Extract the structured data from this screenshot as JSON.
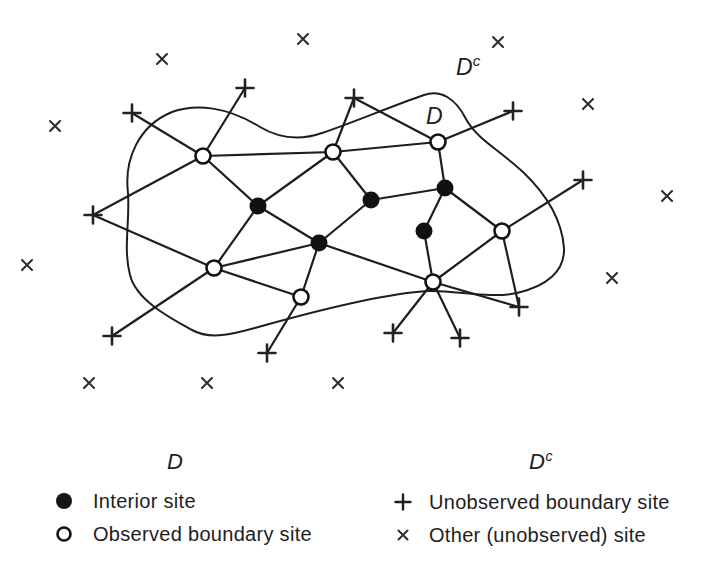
{
  "figure": {
    "width": 726,
    "height": 420,
    "ink_color": "#1e1e1e",
    "background_color": "#ffffff",
    "domain_label": {
      "text": "D",
      "x": 426,
      "y": 124
    },
    "complement_label": {
      "text": "D",
      "superscript": "c",
      "x": 456,
      "y": 75
    },
    "boundary_path": "M128,193 C124,160 138,126 172,112 C196,103 228,107 260,127 C282,140 302,140 322,133 C352,123 392,106 424,95 C441,89 456,99 466,119 C477,139 498,149 523,172 C546,194 562,220 564,248 C565,271 547,286 517,293 C489,299 456,290 428,291 C392,293 330,307 262,326 C236,333 212,341 192,330 C170,318 136,300 130,275 C123,248 130,222 128,193 Z",
    "sites": {
      "interior": [
        [
          258,
          206
        ],
        [
          319,
          243
        ],
        [
          371,
          200
        ],
        [
          445,
          188
        ],
        [
          424,
          231
        ]
      ],
      "observed_boundary": [
        [
          203,
          156
        ],
        [
          333,
          152
        ],
        [
          438,
          142
        ],
        [
          214,
          268
        ],
        [
          301,
          297
        ],
        [
          433,
          282
        ],
        [
          502,
          231
        ]
      ],
      "unobserved_boundary": [
        [
          132,
          113
        ],
        [
          245,
          88
        ],
        [
          93,
          215
        ],
        [
          354,
          98
        ],
        [
          513,
          111
        ],
        [
          583,
          180
        ],
        [
          519,
          307
        ],
        [
          460,
          338
        ],
        [
          393,
          333
        ],
        [
          267,
          353
        ],
        [
          112,
          336
        ]
      ],
      "other": [
        [
          162,
          59
        ],
        [
          303,
          39
        ],
        [
          498,
          42
        ],
        [
          55,
          126
        ],
        [
          588,
          104
        ],
        [
          27,
          265
        ],
        [
          667,
          196
        ],
        [
          612,
          278
        ],
        [
          89,
          383
        ],
        [
          207,
          383
        ],
        [
          338,
          383
        ]
      ]
    },
    "edges": [
      "U1-B1",
      "U2-B1",
      "U3-B1",
      "U3-B4",
      "B1-B2",
      "B1-I1",
      "I1-B2",
      "I1-B4",
      "I1-I2",
      "B4-I2",
      "B4-B5",
      "B4-U11",
      "B2-I3",
      "B2-B3",
      "B2-U4",
      "U4-B3",
      "B3-U5",
      "B3-I4",
      "I3-I4",
      "I3-I2",
      "I4-I5",
      "I4-B7",
      "I2-B5",
      "I2-B6",
      "I5-B6",
      "B7-U6",
      "B7-U7",
      "B7-B6",
      "B6-U7",
      "B6-U8",
      "B6-U9",
      "B5-U10"
    ]
  },
  "legend": {
    "left": {
      "header": "D",
      "items": [
        {
          "symbol": "interior-site-icon",
          "label": "Interior site"
        },
        {
          "symbol": "observed-boundary-site-icon",
          "label": "Observed boundary site"
        }
      ]
    },
    "right": {
      "header": "D",
      "header_superscript": "c",
      "items": [
        {
          "symbol": "unobserved-boundary-site-icon",
          "label": "Unobserved boundary site"
        },
        {
          "symbol": "other-site-icon",
          "label": "Other (unobserved) site"
        }
      ]
    }
  }
}
